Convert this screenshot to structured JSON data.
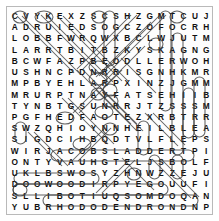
{
  "puzzle": {
    "type": "word-search",
    "title": "",
    "rows": 18,
    "cols": 18,
    "border_color": "#b9b9b9",
    "letter_color": "#101010",
    "mark_color": "#3a3a3a",
    "background_color": "#ffffff",
    "grid": [
      [
        "C",
        "V",
        "Y",
        "K",
        "E",
        "X",
        "Z",
        "S",
        "C",
        "S",
        "H",
        "Z",
        "G",
        "M",
        "T",
        "C",
        "U",
        "J"
      ],
      [
        "A",
        "D",
        "R",
        "U",
        "I",
        "E",
        "D",
        "S",
        "O",
        "G",
        "C",
        "Z",
        "O",
        "F",
        "O",
        "C",
        "R",
        "H"
      ],
      [
        "L",
        "O",
        "B",
        "B",
        "F",
        "W",
        "R",
        "Q",
        "W",
        "X",
        "B",
        "C",
        "L",
        "W",
        "J",
        "U",
        "T",
        "M"
      ],
      [
        "L",
        "A",
        "R",
        "R",
        "T",
        "B",
        "I",
        "T",
        "B",
        "Z",
        "K",
        "Y",
        "S",
        "K",
        "A",
        "G",
        "N",
        "G"
      ],
      [
        "B",
        "C",
        "W",
        "F",
        "A",
        "Z",
        "P",
        "B",
        "E",
        "O",
        "D",
        "L",
        "L",
        "E",
        "R",
        "W",
        "O",
        "H"
      ],
      [
        "U",
        "S",
        "H",
        "N",
        "C",
        "P",
        "D",
        "N",
        "R",
        "R",
        "I",
        "S",
        "G",
        "N",
        "H",
        "K",
        "M",
        "R"
      ],
      [
        "M",
        "P",
        "B",
        "Y",
        "E",
        "H",
        "L",
        "A",
        "R",
        "P",
        "X",
        "I",
        "N",
        "Z",
        "J",
        "G",
        "M",
        "M"
      ],
      [
        "M",
        "R",
        "U",
        "R",
        "P",
        "T",
        "N",
        "A",
        "Y",
        "F",
        "A",
        "T",
        "S",
        "E",
        "H",
        "I",
        "I",
        "B"
      ],
      [
        "T",
        "Y",
        "N",
        "B",
        "T",
        "G",
        "S",
        "U",
        "N",
        "R",
        "R",
        "J",
        "T",
        "Z",
        "S",
        "S",
        "S",
        "M"
      ],
      [
        "P",
        "G",
        "F",
        "H",
        "E",
        "D",
        "F",
        "A",
        "O",
        "T",
        "E",
        "Z",
        "X",
        "R",
        "B",
        "T",
        "R",
        "R"
      ],
      [
        "S",
        "W",
        "Z",
        "Q",
        "H",
        "I",
        "O",
        "Y",
        "N",
        "N",
        "H",
        "E",
        "I",
        "L",
        "B",
        "L",
        "E",
        "A"
      ],
      [
        "S",
        "I",
        "G",
        "D",
        "C",
        "I",
        "H",
        "B",
        "Q",
        "D",
        "T",
        "V",
        "L",
        "F",
        "L",
        "E",
        "P",
        "S"
      ],
      [
        "W",
        "I",
        "R",
        "J",
        "A",
        "C",
        "O",
        "B",
        "S",
        "L",
        "A",
        "D",
        "D",
        "E",
        "R",
        "T",
        "P",
        "I"
      ],
      [
        "O",
        "N",
        "T",
        "Y",
        "V",
        "A",
        "U",
        "H",
        "G",
        "T",
        "E",
        "L",
        "J",
        "S",
        "B",
        "O",
        "L",
        "F"
      ],
      [
        "U",
        "K",
        "L",
        "B",
        "S",
        "W",
        "O",
        "S",
        "Y",
        "Z",
        "H",
        "N",
        "W",
        "Z",
        "Z",
        "E",
        "J",
        "U"
      ],
      [
        "D",
        "O",
        "O",
        "W",
        "O",
        "O",
        "D",
        "I",
        "R",
        "P",
        "Y",
        "E",
        "G",
        "O",
        "U",
        "U",
        "F",
        "I"
      ],
      [
        "S",
        "L",
        "L",
        "I",
        "B",
        "O",
        "T",
        "I",
        "U",
        "Q",
        "S",
        "O",
        "M",
        "D",
        "O",
        "Q",
        "A",
        "N"
      ],
      [
        "Y",
        "U",
        "B",
        "R",
        "H",
        "O",
        "D",
        "O",
        "D",
        "E",
        "N",
        "D",
        "R",
        "O",
        "N",
        "D",
        "N",
        "P"
      ]
    ],
    "found_words": [
      "JACOBSLADDER",
      "DOGWOOD",
      "MOSQUITOBILLS",
      "RHODODENDRON"
    ]
  }
}
